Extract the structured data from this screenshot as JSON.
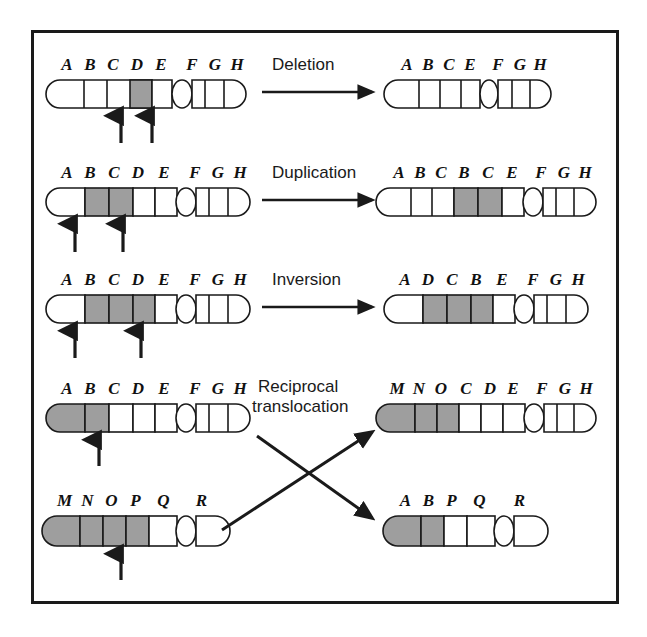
{
  "figure": {
    "border_color": "#1a1a1a",
    "background_color": "#ffffff",
    "shade_color": "#9e9e9e",
    "outline_color": "#1a1a1a"
  },
  "process_labels": [
    {
      "id": "deletion",
      "text": "Deletion"
    },
    {
      "id": "duplication",
      "text": "Duplication"
    },
    {
      "id": "inversion",
      "text": "Inversion"
    },
    {
      "id": "reciprocal-translocation-line1",
      "text": "Reciprocal"
    },
    {
      "id": "reciprocal-translocation-line2",
      "text": "translocation"
    }
  ],
  "rows": [
    {
      "id": "deletion",
      "label": "Deletion",
      "source": {
        "name": "source-chromosome-deletion",
        "bands": [
          {
            "letter": "A",
            "shaded": false
          },
          {
            "letter": "B",
            "shaded": false
          },
          {
            "letter": "C",
            "shaded": false
          },
          {
            "letter": "D",
            "shaded": true
          },
          {
            "letter": "E",
            "shaded": false
          },
          {
            "letter": "F",
            "shaded": false
          },
          {
            "letter": "G",
            "shaded": false
          },
          {
            "letter": "H",
            "shaded": false
          }
        ],
        "centromere_after_index": 4,
        "breakpoint_arrows": 2
      },
      "result": {
        "name": "result-chromosome-deletion",
        "bands": [
          {
            "letter": "A",
            "shaded": false
          },
          {
            "letter": "B",
            "shaded": false
          },
          {
            "letter": "C",
            "shaded": false
          },
          {
            "letter": "E",
            "shaded": false
          },
          {
            "letter": "F",
            "shaded": false
          },
          {
            "letter": "G",
            "shaded": false
          },
          {
            "letter": "H",
            "shaded": false
          }
        ],
        "centromere_after_index": 4
      }
    },
    {
      "id": "duplication",
      "label": "Duplication",
      "source": {
        "name": "source-chromosome-duplication",
        "bands": [
          {
            "letter": "A",
            "shaded": false
          },
          {
            "letter": "B",
            "shaded": true
          },
          {
            "letter": "C",
            "shaded": true
          },
          {
            "letter": "D",
            "shaded": false
          },
          {
            "letter": "E",
            "shaded": false
          },
          {
            "letter": "F",
            "shaded": false
          },
          {
            "letter": "G",
            "shaded": false
          },
          {
            "letter": "H",
            "shaded": false
          }
        ],
        "centromere_after_index": 5,
        "breakpoint_arrows": 2
      },
      "result": {
        "name": "result-chromosome-duplication",
        "bands": [
          {
            "letter": "A",
            "shaded": false
          },
          {
            "letter": "B",
            "shaded": false
          },
          {
            "letter": "C",
            "shaded": false
          },
          {
            "letter": "B",
            "shaded": true
          },
          {
            "letter": "C",
            "shaded": true
          },
          {
            "letter": "E",
            "shaded": false
          },
          {
            "letter": "F",
            "shaded": false
          },
          {
            "letter": "G",
            "shaded": false
          },
          {
            "letter": "H",
            "shaded": false
          }
        ],
        "centromere_after_index": 6
      }
    },
    {
      "id": "inversion",
      "label": "Inversion",
      "source": {
        "name": "source-chromosome-inversion",
        "bands": [
          {
            "letter": "A",
            "shaded": false
          },
          {
            "letter": "B",
            "shaded": true
          },
          {
            "letter": "C",
            "shaded": true
          },
          {
            "letter": "D",
            "shaded": true
          },
          {
            "letter": "E",
            "shaded": false
          },
          {
            "letter": "F",
            "shaded": false
          },
          {
            "letter": "G",
            "shaded": false
          },
          {
            "letter": "H",
            "shaded": false
          }
        ],
        "centromere_after_index": 5,
        "breakpoint_arrows": 2
      },
      "result": {
        "name": "result-chromosome-inversion",
        "bands": [
          {
            "letter": "A",
            "shaded": false
          },
          {
            "letter": "D",
            "shaded": true
          },
          {
            "letter": "C",
            "shaded": true
          },
          {
            "letter": "B",
            "shaded": true
          },
          {
            "letter": "E",
            "shaded": false
          },
          {
            "letter": "F",
            "shaded": false
          },
          {
            "letter": "G",
            "shaded": false
          },
          {
            "letter": "H",
            "shaded": false
          }
        ],
        "centromere_after_index": 5
      }
    },
    {
      "id": "translocation-upper",
      "label": "Reciprocal translocation",
      "source": {
        "name": "source-chromosome-translocation-abcdefgh",
        "bands": [
          {
            "letter": "A",
            "shaded": true
          },
          {
            "letter": "B",
            "shaded": true
          },
          {
            "letter": "C",
            "shaded": false
          },
          {
            "letter": "D",
            "shaded": false
          },
          {
            "letter": "E",
            "shaded": false
          },
          {
            "letter": "F",
            "shaded": false
          },
          {
            "letter": "G",
            "shaded": false
          },
          {
            "letter": "H",
            "shaded": false
          }
        ],
        "centromere_after_index": 5,
        "breakpoint_arrows": 1
      },
      "result": {
        "name": "result-chromosome-mnocdefgh",
        "bands": [
          {
            "letter": "M",
            "shaded": true
          },
          {
            "letter": "N",
            "shaded": true
          },
          {
            "letter": "O",
            "shaded": true
          },
          {
            "letter": "C",
            "shaded": false
          },
          {
            "letter": "D",
            "shaded": false
          },
          {
            "letter": "E",
            "shaded": false
          },
          {
            "letter": "F",
            "shaded": false
          },
          {
            "letter": "G",
            "shaded": false
          },
          {
            "letter": "H",
            "shaded": false
          }
        ],
        "centromere_after_index": 6
      }
    },
    {
      "id": "translocation-lower",
      "label": "",
      "source": {
        "name": "source-chromosome-translocation-mnopqr",
        "bands": [
          {
            "letter": "M",
            "shaded": true
          },
          {
            "letter": "N",
            "shaded": true
          },
          {
            "letter": "O",
            "shaded": true
          },
          {
            "letter": "P",
            "shaded": true
          },
          {
            "letter": "Q",
            "shaded": false
          },
          {
            "letter": "R",
            "shaded": false
          }
        ],
        "centromere_after_index": 5,
        "breakpoint_arrows": 1
      },
      "result": {
        "name": "result-chromosome-abpqr",
        "bands": [
          {
            "letter": "A",
            "shaded": true
          },
          {
            "letter": "B",
            "shaded": true
          },
          {
            "letter": "P",
            "shaded": false
          },
          {
            "letter": "Q",
            "shaded": false
          },
          {
            "letter": "R",
            "shaded": false
          }
        ],
        "centromere_after_index": 4
      }
    }
  ],
  "arrows": {
    "straight": [
      {
        "name": "deletion-arrow"
      },
      {
        "name": "duplication-arrow"
      },
      {
        "name": "inversion-arrow"
      }
    ],
    "crossing": [
      {
        "name": "translocation-arrow-up"
      },
      {
        "name": "translocation-arrow-down"
      }
    ]
  }
}
